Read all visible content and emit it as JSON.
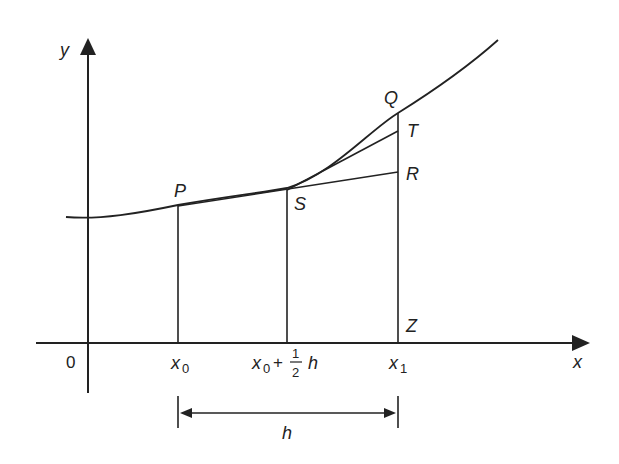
{
  "diagram": {
    "axes": {
      "x_label": "x",
      "y_label": "y",
      "origin_label": "0"
    },
    "points": {
      "P": "P",
      "Q": "Q",
      "R": "R",
      "S": "S",
      "T": "T",
      "Z": "Z"
    },
    "ticks": {
      "x0": "x",
      "x0_sub": "0",
      "mid_prefix": "x",
      "mid_sub": "0",
      "mid_plus": "+",
      "mid_frac_num": "1",
      "mid_frac_den": "2",
      "mid_h": "h",
      "x1": "x",
      "x1_sub": "1"
    },
    "interval": {
      "label": "h"
    },
    "colors": {
      "line": "#2a2a2a",
      "background": "#ffffff"
    }
  }
}
